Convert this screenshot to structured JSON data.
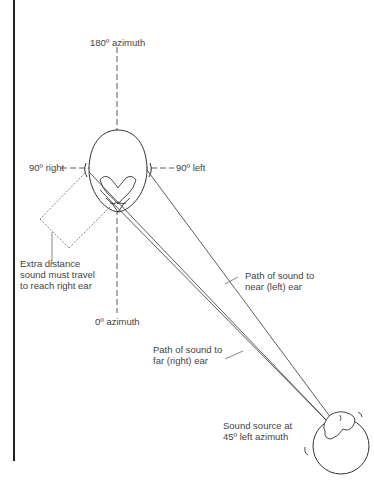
{
  "diagram": {
    "type": "sound-localization",
    "labels": {
      "azimuth_180": "180º azimuth",
      "right_90": "90º right",
      "left_90": "90º left",
      "azimuth_0": "0º azimuth",
      "extra_distance": [
        "Extra distance",
        "sound must travel",
        "to reach right ear"
      ],
      "near_path": [
        "Path of sound to",
        "near (left) ear"
      ],
      "far_path": [
        "Path of sound to",
        "far (right) ear"
      ],
      "source": [
        "Sound source at",
        "45º left azimuth"
      ]
    },
    "colors": {
      "line": "#333333",
      "text": "#444444",
      "background": "#ffffff"
    }
  }
}
